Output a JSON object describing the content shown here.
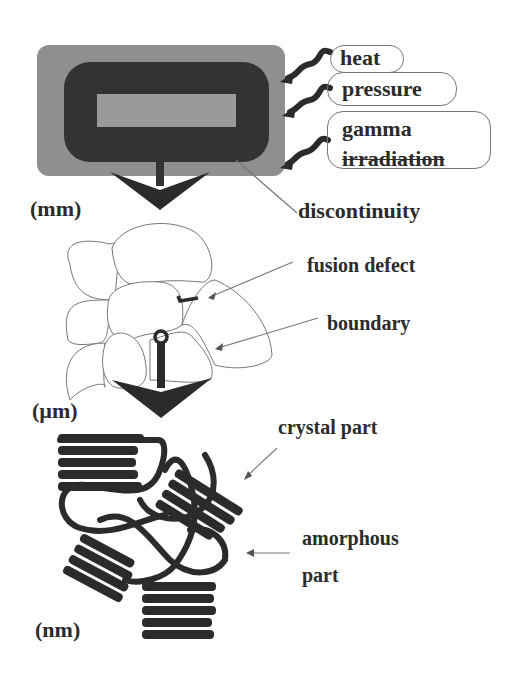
{
  "diagram": {
    "scales": {
      "mm": "(mm)",
      "um": "(µm)",
      "nm": "(nm)"
    },
    "stimuli": [
      {
        "label": "heat"
      },
      {
        "label": "pressure"
      },
      {
        "label": "gamma"
      },
      {
        "label": "irradiation"
      }
    ],
    "annotations": {
      "discontinuity": "discontinuity",
      "fusion_defect": "fusion defect",
      "boundary": "boundary",
      "crystal_part": "crystal part",
      "amorphous_line1": "amorphous",
      "amorphous_line2": "part"
    },
    "colors": {
      "outer_block": "#8f8f8f",
      "ring": "#333333",
      "inner_block": "#9a9a9a",
      "ink": "#2b2b2b",
      "thin_line": "#777777"
    }
  }
}
